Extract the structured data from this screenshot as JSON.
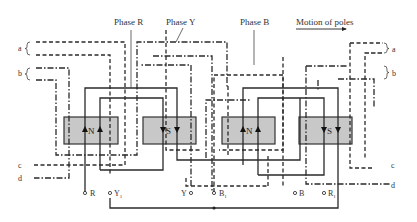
{
  "title_labels": {
    "phase_r": "Phase R",
    "phase_y": "Phase Y",
    "phase_b": "Phase B",
    "motion": "Motion of poles"
  },
  "brace_labels": {
    "left_a": "a",
    "left_b": "b",
    "right_a": "a",
    "right_b": "b",
    "left_c": "c",
    "left_d": "d",
    "right_c": "c",
    "right_d": "d"
  },
  "poles": [
    {
      "label": "N",
      "arrows": "up"
    },
    {
      "label": "S",
      "arrows": "down"
    },
    {
      "label": "N",
      "arrows": "up"
    },
    {
      "label": "S",
      "arrows": "down"
    }
  ],
  "terminals": {
    "r": "R",
    "y1": "Y",
    "y1_sub": "1",
    "y": "Y",
    "b1": "B",
    "b1_sub": "1",
    "b": "B",
    "r1": "R",
    "r1_sub": "1"
  },
  "legend": {
    "phase_r_style": "solid",
    "phase_y_style": "dash-dot",
    "phase_b_style": "dashed"
  }
}
